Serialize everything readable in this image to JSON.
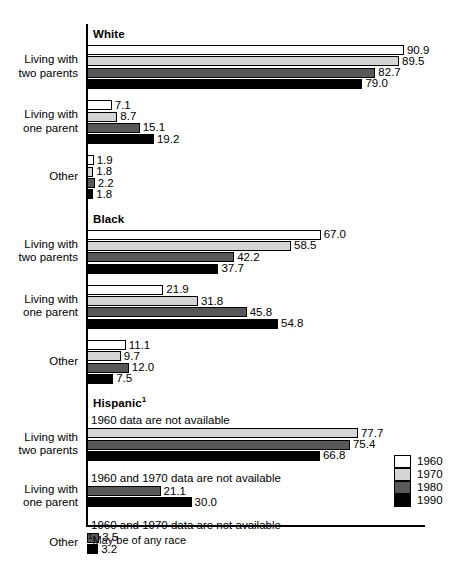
{
  "chart_data": {
    "type": "bar",
    "title": "",
    "xlabel": "",
    "ylabel": "",
    "orientation": "horizontal",
    "grid": false,
    "xlim": [
      0,
      100
    ],
    "legend_position": "bottom-right",
    "series": [
      {
        "name": "1960",
        "color": "#ffffff"
      },
      {
        "name": "1970",
        "color": "#d5d5d5"
      },
      {
        "name": "1980",
        "color": "#585858"
      },
      {
        "name": "1990",
        "color": "#000000"
      }
    ],
    "groups": [
      {
        "name": "White",
        "categories": [
          {
            "label_line1": "Living with",
            "label_line2": "two parents",
            "values": [
              90.9,
              89.5,
              82.7,
              79.0
            ],
            "value_labels": [
              "90.9",
              "89.5",
              "82.7",
              "79.0"
            ],
            "note": ""
          },
          {
            "label_line1": "Living with",
            "label_line2": "one parent",
            "values": [
              7.1,
              8.7,
              15.1,
              19.2
            ],
            "value_labels": [
              "7.1",
              "8.7",
              "15.1",
              "19.2"
            ],
            "note": ""
          },
          {
            "label_line1": "Other",
            "label_line2": "",
            "values": [
              1.9,
              1.8,
              2.2,
              1.8
            ],
            "value_labels": [
              "1.9",
              "1.8",
              "2.2",
              "1.8"
            ],
            "note": ""
          }
        ]
      },
      {
        "name": "Black",
        "categories": [
          {
            "label_line1": "Living with",
            "label_line2": "two parents",
            "values": [
              67.0,
              58.5,
              42.2,
              37.7
            ],
            "value_labels": [
              "67.0",
              "58.5",
              "42.2",
              "37.7"
            ],
            "note": ""
          },
          {
            "label_line1": "Living with",
            "label_line2": "one parent",
            "values": [
              21.9,
              31.8,
              45.8,
              54.8
            ],
            "value_labels": [
              "21.9",
              "31.8",
              "45.8",
              "54.8"
            ],
            "note": ""
          },
          {
            "label_line1": "Other",
            "label_line2": "",
            "values": [
              11.1,
              9.7,
              12.0,
              7.5
            ],
            "value_labels": [
              "11.1",
              "9.7",
              "12.0",
              "7.5"
            ],
            "note": ""
          }
        ]
      },
      {
        "name": "Hispanic",
        "name_footnote_marker": "1",
        "categories": [
          {
            "label_line1": "Living with",
            "label_line2": "two parents",
            "values": [
              null,
              77.7,
              75.4,
              66.8
            ],
            "value_labels": [
              "",
              "77.7",
              "75.4",
              "66.8"
            ],
            "note": "1960 data are not available"
          },
          {
            "label_line1": "Living with",
            "label_line2": "one parent",
            "values": [
              null,
              null,
              21.1,
              30.0
            ],
            "value_labels": [
              "",
              "",
              "21.1",
              "30.0"
            ],
            "note": "1960 and 1970 data are not available"
          },
          {
            "label_line1": "Other",
            "label_line2": "",
            "values": [
              null,
              null,
              3.5,
              3.2
            ],
            "value_labels": [
              "",
              "",
              "3.5",
              "3.2"
            ],
            "note": "1960 and 1970 data are not available"
          }
        ]
      }
    ],
    "footnote": "May be of any race",
    "footnote_marker": "1"
  }
}
